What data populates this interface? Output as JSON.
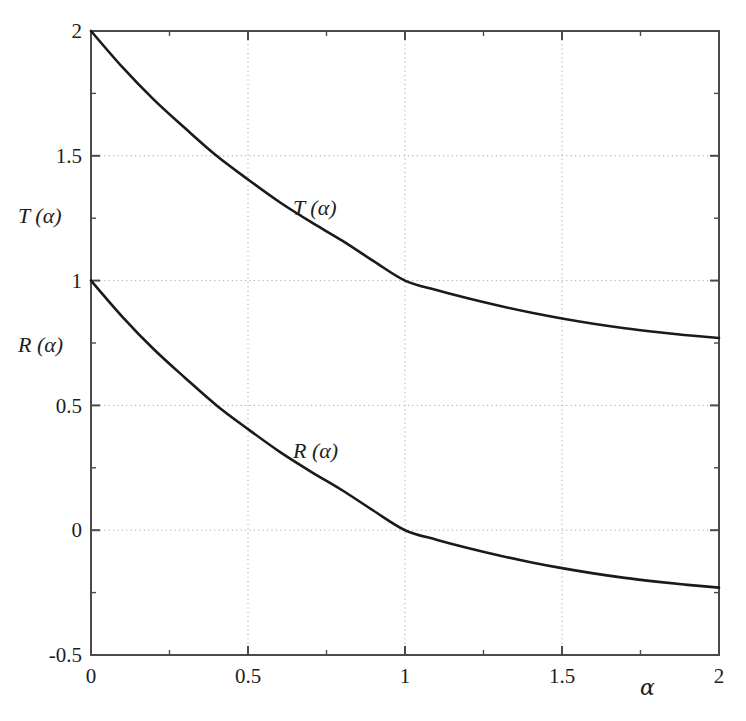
{
  "figure": {
    "background_color": "#ffffff",
    "curve_color": "#1a1a1a",
    "axis_color": "#4a4a4a",
    "grid_color": "#a9a9a9"
  },
  "axes": {
    "x_axis_label": "α",
    "y_axis_labels": [
      "T (α)",
      "R (α)"
    ],
    "x_ticks": [
      "0",
      "0.5",
      "1",
      "1.5",
      "2"
    ],
    "y_ticks": [
      "-0.5",
      "0",
      "0.5",
      "1",
      "1.5",
      "2"
    ]
  },
  "curve_labels": {
    "t_label": "T (α)",
    "r_label": "R (α)"
  },
  "chart_data": {
    "type": "line",
    "title": "",
    "xlabel": "α",
    "ylabel": "T (α)  /  R (α)",
    "xlim": [
      0,
      2
    ],
    "ylim": [
      -0.5,
      2
    ],
    "xticks": [
      0,
      0.5,
      1,
      1.5,
      2
    ],
    "yticks": [
      -0.5,
      0,
      0.5,
      1,
      1.5,
      2
    ],
    "grid": true,
    "grid_style": "dotted",
    "legend": "inline-curve-labels",
    "x": [
      0,
      0.1,
      0.2,
      0.3,
      0.4,
      0.5,
      0.6,
      0.7,
      0.8,
      0.9,
      1.0,
      1.1,
      1.2,
      1.3,
      1.4,
      1.5,
      1.6,
      1.7,
      1.8,
      1.9,
      2.0
    ],
    "series": [
      {
        "name": "T (α)",
        "label_position": {
          "x": 0.65,
          "y": 1.32
        },
        "values": [
          2.0,
          1.855,
          1.725,
          1.61,
          1.5,
          1.405,
          1.315,
          1.235,
          1.16,
          1.078,
          1.0,
          0.962,
          0.929,
          0.899,
          0.872,
          0.848,
          0.827,
          0.809,
          0.794,
          0.781,
          0.77
        ]
      },
      {
        "name": "R (α)",
        "label_position": {
          "x": 0.65,
          "y": 0.325
        },
        "values": [
          1.0,
          0.855,
          0.725,
          0.61,
          0.5,
          0.405,
          0.315,
          0.235,
          0.16,
          0.078,
          0.0,
          -0.038,
          -0.071,
          -0.101,
          -0.128,
          -0.152,
          -0.173,
          -0.191,
          -0.206,
          -0.219,
          -0.23
        ]
      }
    ],
    "annotations": [
      {
        "text": "T (α)",
        "x": 0.65,
        "y": 1.32
      },
      {
        "text": "R (α)",
        "x": 0.65,
        "y": 0.325
      }
    ]
  }
}
